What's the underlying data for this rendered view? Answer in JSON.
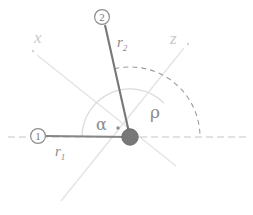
{
  "figure": {
    "width": 253,
    "height": 215,
    "background": "#ffffff"
  },
  "colors": {
    "link": "#818181",
    "link_dark": "#6f6f6f",
    "hub_fill": "#777777",
    "hub_stroke": "#6a6a6a",
    "axis_light": "#e2e2e2",
    "axis_dashed": "#c6c6c6",
    "arc_solid": "#d8d8d8",
    "arc_dashed": "#9a9a9a",
    "label_gray": "#8a8a8a",
    "label_light": "#c9c9c9"
  },
  "labels": {
    "axis_x": "x",
    "axis_z": "z",
    "link_1": "r",
    "link_1_sub": "1",
    "link_2": "r",
    "link_2_sub": "2",
    "angle_alpha": "α",
    "angle_rho": "ρ",
    "joint_1": "1",
    "joint_2": "2"
  },
  "geometry": {
    "hub": {
      "x": 130,
      "y": 137,
      "r": 8
    },
    "joint_1_marker": {
      "x": 38,
      "y": 136,
      "r": 7.5
    },
    "joint_2_marker": {
      "x": 102,
      "y": 17,
      "r": 7.5
    },
    "link_1": {
      "x1": 46,
      "y1": 136,
      "x2": 130,
      "y2": 137
    },
    "link_2": {
      "x1": 130,
      "y1": 137,
      "x2": 105,
      "y2": 25
    },
    "horizontal_axis": {
      "x1": 8,
      "y1": 137,
      "x2": 246,
      "y2": 137
    },
    "axis_x_line": {
      "x1": 37,
      "y1": 55,
      "x2": 176,
      "y2": 166
    },
    "axis_z_line": {
      "x1": 184,
      "y1": 48,
      "x2": 61,
      "y2": 201
    },
    "arc_alpha": {
      "cx": 130,
      "cy": 137,
      "r": 48
    },
    "arc_rho": {
      "cx": 130,
      "cy": 137,
      "r": 70
    },
    "pivot_dot": {
      "x": 118,
      "y": 128,
      "r": 1.6
    }
  }
}
